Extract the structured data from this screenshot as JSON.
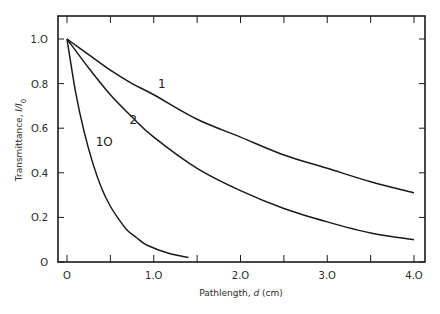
{
  "chart_data": {
    "type": "line",
    "title": "",
    "xlabel": "Pathlength, d (cm)",
    "ylabel": "Transmittance, I/I0",
    "xlim": [
      0,
      4.0
    ],
    "ylim": [
      0,
      1.0
    ],
    "grid": false,
    "legend": "none (curves labelled inline)",
    "x_ticks": [
      0,
      0.5,
      1.0,
      1.5,
      2.0,
      2.5,
      3.0,
      3.5,
      4.0
    ],
    "x_tick_labels": [
      "O",
      "1.O",
      "2.O",
      "3.O",
      "4.O"
    ],
    "x_tick_label_values": [
      0,
      1.0,
      2.0,
      3.0,
      4.0
    ],
    "y_ticks": [
      0,
      0.2,
      0.4,
      0.6,
      0.8,
      1.0
    ],
    "y_tick_labels": [
      "O",
      "O.2",
      "O.4",
      "O.6",
      "O.8",
      "1.O"
    ],
    "series": [
      {
        "name": "1",
        "x": [
          0,
          0.25,
          0.5,
          0.75,
          1.0,
          1.5,
          2.0,
          2.5,
          3.0,
          3.5,
          4.0
        ],
        "values": [
          1.0,
          0.93,
          0.86,
          0.8,
          0.75,
          0.64,
          0.56,
          0.48,
          0.42,
          0.36,
          0.31
        ]
      },
      {
        "name": "2",
        "x": [
          0,
          0.25,
          0.5,
          0.75,
          1.0,
          1.5,
          2.0,
          2.5,
          3.0,
          3.5,
          4.0
        ],
        "values": [
          1.0,
          0.87,
          0.75,
          0.65,
          0.56,
          0.42,
          0.32,
          0.24,
          0.18,
          0.13,
          0.1
        ]
      },
      {
        "name": "10",
        "x": [
          0,
          0.1,
          0.2,
          0.3,
          0.4,
          0.5,
          0.6,
          0.7,
          0.8,
          0.9,
          1.0,
          1.1,
          1.2,
          1.3,
          1.4
        ],
        "values": [
          1.0,
          0.76,
          0.58,
          0.44,
          0.33,
          0.25,
          0.19,
          0.14,
          0.11,
          0.08,
          0.063,
          0.048,
          0.036,
          0.028,
          0.02
        ]
      }
    ],
    "annotations": [
      {
        "text": "1",
        "x": 1.05,
        "y": 0.78
      },
      {
        "text": "2",
        "x": 0.72,
        "y": 0.62
      },
      {
        "text": "1O",
        "x": 0.33,
        "y": 0.52
      }
    ]
  },
  "labels": {
    "x_axis": "Pathlength, d (cm)",
    "y_axis": "Transmittance, I/I0"
  }
}
